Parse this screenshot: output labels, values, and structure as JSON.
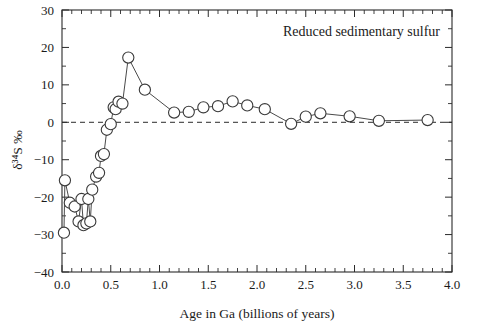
{
  "chart_data": {
    "type": "line",
    "title": "Reduced sedimentary sulfur",
    "xlabel": "Age in Ga (billions of years)",
    "ylabel": "δ³⁴S ‰",
    "xlim": [
      0.0,
      4.0
    ],
    "ylim": [
      -40,
      30
    ],
    "grid": false,
    "legend": null,
    "zero_reference_line": 0,
    "xticks": [
      "0.0",
      "0.5",
      "1.0",
      "1.5",
      "2.0",
      "2.5",
      "3.0",
      "3.5",
      "4.0"
    ],
    "xtick_values": [
      0.0,
      0.5,
      1.0,
      1.5,
      2.0,
      2.5,
      3.0,
      3.5,
      4.0
    ],
    "xtick_minor_step": 0.1,
    "yticks": [
      "30",
      "20",
      "10",
      "0",
      "−10",
      "−20",
      "−30",
      "−40"
    ],
    "ytick_values": [
      30,
      20,
      10,
      0,
      -10,
      -20,
      -30,
      -40
    ],
    "ytick_minor_step": 5,
    "series": [
      {
        "name": "Reduced sedimentary sulfur",
        "marker": "open-circle",
        "x": [
          0.02,
          0.03,
          0.08,
          0.13,
          0.17,
          0.2,
          0.22,
          0.25,
          0.27,
          0.29,
          0.31,
          0.35,
          0.38,
          0.4,
          0.43,
          0.46,
          0.5,
          0.53,
          0.55,
          0.58,
          0.62,
          0.68,
          0.85,
          1.15,
          1.3,
          1.45,
          1.6,
          1.75,
          1.9,
          2.08,
          2.35,
          2.5,
          2.65,
          2.95,
          3.25,
          3.75
        ],
        "y": [
          -29.5,
          -15.5,
          -21.5,
          -22.5,
          -26.5,
          -20.5,
          -27.5,
          -27.0,
          -20.5,
          -26.5,
          -18.0,
          -14.5,
          -13.5,
          -9.0,
          -8.5,
          -2.0,
          -0.5,
          4.0,
          3.5,
          5.5,
          5.0,
          17.3,
          8.7,
          2.6,
          2.8,
          4.0,
          4.3,
          5.6,
          4.5,
          3.5,
          -0.4,
          1.5,
          2.4,
          1.6,
          0.4,
          0.6
        ]
      }
    ]
  },
  "axes": {
    "title_position": "top-right-inside",
    "frame": "box"
  },
  "colors": {
    "background": "#ffffff",
    "axis": "#2b2b2b",
    "series_line": "#4a4a4a",
    "marker_stroke": "#3a3a3a",
    "marker_fill": "#ffffff",
    "text": "#1a1a1a"
  }
}
